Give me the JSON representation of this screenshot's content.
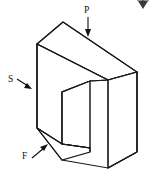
{
  "figure": {
    "diagram_type": "isometric-solid-sketch",
    "background_color": "#ffffff",
    "line_color": "#1a1a1a",
    "face_fill": "#ffffff",
    "labels": [
      {
        "id": "P",
        "text": "P",
        "description": "Compressive load applied downward on the top face",
        "arrow_direction": "down",
        "position": "top-center"
      },
      {
        "id": "S",
        "text": "S",
        "description": "Load pointing toward the left side face",
        "arrow_direction": "down-right",
        "position": "left-middle"
      },
      {
        "id": "F",
        "text": "F",
        "description": "Load pointing up-right at the lower left leg",
        "arrow_direction": "up-right",
        "position": "bottom-left"
      }
    ],
    "artifact": {
      "name": "cropped-arrow-glyph",
      "description": "Partially cropped arrow glyph at top right edge of image"
    }
  }
}
